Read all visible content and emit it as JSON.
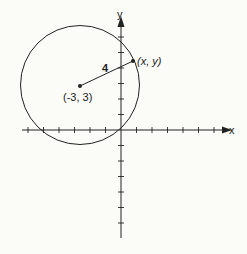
{
  "diagram": {
    "axes": {
      "x_label": "x",
      "y_label": "y"
    },
    "circle": {
      "center_label": "(-3, 3)",
      "radius_label": "4"
    },
    "point_label": "(x, y)",
    "colors": {
      "ink": "#222222",
      "background": "#fbfbf8"
    }
  }
}
